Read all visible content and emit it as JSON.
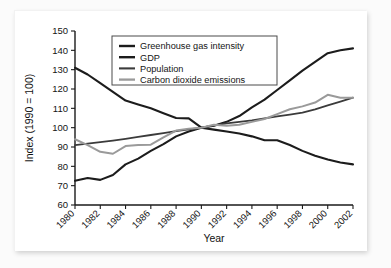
{
  "chart_data": {
    "type": "line",
    "title": "",
    "xlabel": "Year",
    "ylabel": "Index (1990 = 100)",
    "xlim": [
      1980,
      2002
    ],
    "ylim": [
      60,
      150
    ],
    "grid": false,
    "legend_position": "top-center",
    "x": [
      1980,
      1981,
      1982,
      1983,
      1984,
      1985,
      1986,
      1987,
      1988,
      1989,
      1990,
      1991,
      1992,
      1993,
      1994,
      1995,
      1996,
      1997,
      1998,
      1999,
      2000,
      2001,
      2002
    ],
    "xticks": [
      1980,
      1982,
      1984,
      1986,
      1988,
      1990,
      1992,
      1994,
      1996,
      1998,
      2000,
      2002
    ],
    "xtick_labels": [
      "1980",
      "1982",
      "1984",
      "1986",
      "1988",
      "1990",
      "1992",
      "1994",
      "1996",
      "1998",
      "2000",
      "2002"
    ],
    "yticks": [
      60,
      70,
      80,
      90,
      100,
      110,
      120,
      130,
      140,
      150
    ],
    "ytick_labels": [
      "60",
      "70",
      "80",
      "90",
      "100",
      "110",
      "120",
      "130",
      "140",
      "150"
    ],
    "series": [
      {
        "name": "Greenhouse gas intensity",
        "color": "#1c1c1c",
        "width": 2.1,
        "values": [
          131.0,
          127.5,
          123.0,
          118.5,
          114.0,
          112.0,
          110.0,
          107.5,
          105.0,
          104.8,
          100.0,
          99.0,
          98.0,
          97.0,
          95.5,
          93.5,
          93.5,
          91.0,
          88.0,
          85.5,
          83.5,
          82.0,
          81.0
        ]
      },
      {
        "name": "GDP",
        "color": "#1c1c1c",
        "width": 2.1,
        "values": [
          72.5,
          74.0,
          73.0,
          75.5,
          81.0,
          84.0,
          88.0,
          91.5,
          95.5,
          98.0,
          100.0,
          101.0,
          103.0,
          106.0,
          110.5,
          114.5,
          119.5,
          124.5,
          129.5,
          134.0,
          138.5,
          140.0,
          141.0
        ]
      },
      {
        "name": "Population",
        "color": "#3b3b3b",
        "width": 1.8,
        "values": [
          91.0,
          91.8,
          92.5,
          93.3,
          94.2,
          95.2,
          96.2,
          97.2,
          98.2,
          99.1,
          100.0,
          101.2,
          102.2,
          103.0,
          103.8,
          104.8,
          105.8,
          106.8,
          107.8,
          109.5,
          111.5,
          113.5,
          115.5
        ]
      },
      {
        "name": "Carbon dioxide emissions",
        "color": "#9a9a9a",
        "width": 2.0,
        "values": [
          94.0,
          91.0,
          87.5,
          86.5,
          90.5,
          91.0,
          91.2,
          95.0,
          98.5,
          99.5,
          100.0,
          101.5,
          101.0,
          101.5,
          103.0,
          104.5,
          107.0,
          109.5,
          111.0,
          113.0,
          117.0,
          115.5,
          115.5
        ]
      }
    ]
  },
  "legend": {
    "items": [
      {
        "label": "Greenhouse gas intensity"
      },
      {
        "label": "GDP"
      },
      {
        "label": "Population"
      },
      {
        "label": "Carbon dioxide emissions"
      }
    ]
  },
  "axes": {
    "y_title": "Index (1990 = 100)",
    "x_title": "Year"
  }
}
